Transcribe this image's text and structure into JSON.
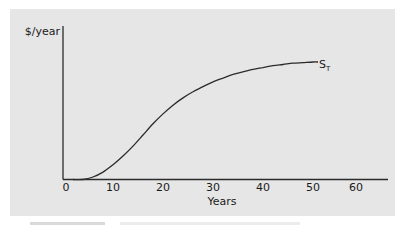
{
  "chart_data": {
    "type": "line",
    "title": "",
    "xlabel": "Years",
    "ylabel": "$/year",
    "xlim": [
      0,
      66
    ],
    "ylim": [
      0,
      1
    ],
    "grid": false,
    "legend": "none",
    "x_ticks": [
      "0",
      "10",
      "20",
      "30",
      "40",
      "50",
      "60"
    ],
    "y_ticks": [],
    "series": [
      {
        "name": "S_T",
        "label": "S",
        "label_subscript": "T",
        "x": [
          0,
          2,
          4,
          6,
          8,
          10,
          12,
          14,
          16,
          18,
          20,
          22,
          24,
          26,
          28,
          30,
          32,
          34,
          36,
          38,
          40,
          42,
          44,
          46,
          48,
          49
        ],
        "values": [
          0.0,
          0.0,
          0.02,
          0.06,
          0.12,
          0.19,
          0.27,
          0.36,
          0.45,
          0.53,
          0.6,
          0.66,
          0.71,
          0.75,
          0.79,
          0.82,
          0.85,
          0.87,
          0.89,
          0.905,
          0.92,
          0.93,
          0.94,
          0.945,
          0.95,
          0.95
        ]
      }
    ],
    "annotations": [
      {
        "text": "S_T",
        "near_x": 50,
        "near_y": 0.95
      }
    ],
    "shape": "S-shaped (logistic) curve rising from 0 and leveling off near year 50"
  },
  "axes": {
    "y_label": "$/year",
    "x_label": "Years",
    "x_tick_labels": [
      "0",
      "10",
      "20",
      "30",
      "40",
      "50",
      "60"
    ]
  },
  "curve_label": {
    "main": "S",
    "sub": "T"
  },
  "colors": {
    "panel": "#e6e6e6",
    "axis": "#2b2b2b",
    "curve": "#2b2b2b",
    "text": "#1a1a1a"
  }
}
